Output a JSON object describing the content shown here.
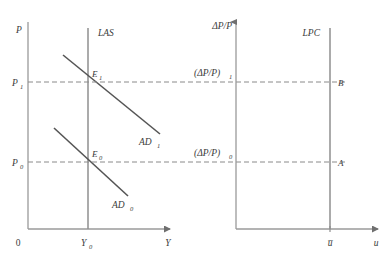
{
  "figure": {
    "width": 388,
    "height": 258,
    "background": "#ffffff",
    "axis_color": "#9a9a9a",
    "curve_color": "#555555",
    "vertical_curve_color": "#8f8f8f",
    "dash_color": "#8a8a8a",
    "text_color": "#3a3a3a"
  },
  "left_panel": {
    "name": "ad-as-diagram",
    "y_axis_label": "P",
    "x_axis_label": "Y",
    "origin_label": "0",
    "y_ticks": [
      {
        "id": "p1",
        "label_main": "P",
        "label_sub": "1",
        "y": 82
      },
      {
        "id": "p0",
        "label_main": "P",
        "label_sub": "0",
        "y": 162
      }
    ],
    "x_ticks": [
      {
        "id": "y0",
        "label_main": "Y",
        "label_sub": "0",
        "x": 88
      }
    ],
    "vertical_curve": {
      "label": "LAS",
      "x": 88
    },
    "demand_curves": [
      {
        "id": "ad1",
        "label_main": "AD",
        "label_sub": "1",
        "x1": 63,
        "y1": 55,
        "x2": 160,
        "y2": 134
      },
      {
        "id": "ad0",
        "label_main": "AD",
        "label_sub": "0",
        "x1": 54,
        "y1": 128,
        "x2": 128,
        "y2": 196
      }
    ],
    "equilibria": [
      {
        "id": "e1",
        "label_main": "E",
        "label_sub": "1",
        "x": 88,
        "y": 82
      },
      {
        "id": "e0",
        "label_main": "E",
        "label_sub": "0",
        "x": 88,
        "y": 162
      }
    ]
  },
  "right_panel": {
    "name": "long-run-phillips-curve-diagram",
    "y_axis_label": "ΔP/P",
    "x_axis_label": "u",
    "x_axis_label_bar": "u̅",
    "y_ticks": [
      {
        "id": "infl1",
        "label_main": "(ΔP/P)",
        "label_sub": "1",
        "y": 82
      },
      {
        "id": "infl0",
        "label_main": "(ΔP/P)",
        "label_sub": "0",
        "y": 162
      }
    ],
    "x_ticks": [
      {
        "id": "ubar",
        "label": "u̅",
        "x": 330
      }
    ],
    "vertical_curve": {
      "label": "LPC",
      "x": 330
    },
    "points": [
      {
        "id": "b",
        "label": "B",
        "x": 330,
        "y": 82
      },
      {
        "id": "a",
        "label": "A",
        "x": 330,
        "y": 162
      }
    ]
  },
  "connectors": [
    {
      "id": "dash-p1",
      "y": 82,
      "x_start": 28,
      "x_end": 345
    },
    {
      "id": "dash-p0",
      "y": 162,
      "x_start": 28,
      "x_end": 345
    }
  ]
}
